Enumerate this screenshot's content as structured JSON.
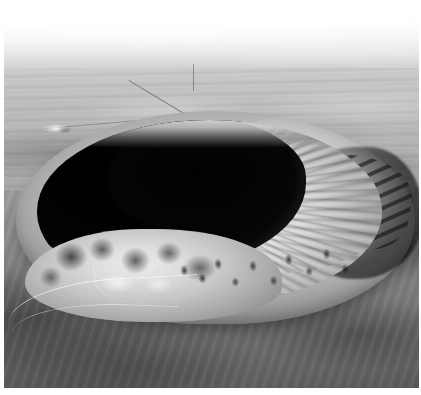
{
  "photo": {
    "kind": "photograph",
    "medium": "aerial-photograph",
    "color_mode": "grayscale",
    "orientation": "oblique-aerial",
    "subject": "meteorite impact crater",
    "alt_text": "Black and white oblique aerial photograph of a large bowl-shaped meteorite impact crater in a flat desert plain. The near and left inner walls are in deep black shadow while the right inner wall is brightly sunlit and scored with radial gullies. A raised light-toned rim encircles the bowl, a thin road winds up the lower-left flank, and the hazy horizon fades to white across the top of the frame.",
    "width": 421,
    "height": 395,
    "border": {
      "left_px": 4,
      "right_px": 2,
      "top_px": 0,
      "bottom_px": 7,
      "color": "#ffffff"
    },
    "regions": [
      {
        "name": "horizon-haze",
        "label": "Hazy washed-out horizon",
        "tone": "white to light gray",
        "color": "#ffffff"
      },
      {
        "name": "desert-plain",
        "label": "Flat desert plain with streaked surface",
        "tone": "light-mid gray",
        "color": "#bbbbbb"
      },
      {
        "name": "highway",
        "label": "Straight road crossing the plain",
        "tone": "thin dark line",
        "color": "#4a4a4a"
      },
      {
        "name": "settlement",
        "label": "Small bright structure cluster on the plain",
        "tone": "bright specks",
        "color": "#f0f0f0"
      },
      {
        "name": "crater-rim",
        "label": "Raised light-toned crater rim",
        "tone": "bright gray",
        "color": "#c9c9c9"
      },
      {
        "name": "crater-shadow",
        "label": "Deeply shadowed north and west inner wall",
        "tone": "near black",
        "color": "#070707"
      },
      {
        "name": "sunlit-inner-wall",
        "label": "Sunlit inner wall with radial gullies",
        "tone": "bright white-gray",
        "color": "#e2e2e2"
      },
      {
        "name": "south-rim-terrace",
        "label": "Broken blocky south rim and visitor terrace",
        "tone": "bright with dark blocks",
        "color": "#d8d8d8"
      },
      {
        "name": "boulder-field",
        "label": "Scattered dark boulders on the southeast rim",
        "tone": "dark specks",
        "color": "#141414"
      },
      {
        "name": "access-road",
        "label": "Road winding up the outer south flank",
        "tone": "thin bright line",
        "color": "#f6f6f6"
      },
      {
        "name": "ejecta-apron",
        "label": "Darker ejecta apron in the foreground",
        "tone": "mid to dark gray",
        "color": "#737373"
      }
    ],
    "palette": {
      "highlight": "#ffffff",
      "plain": "#b4b4b4",
      "rim": "#c9c9c9",
      "apron": "#737373",
      "shadow": "#070707"
    }
  }
}
